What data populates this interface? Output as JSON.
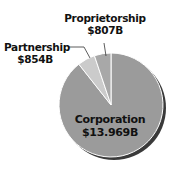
{
  "chart_data": {
    "type": "pie",
    "title": "",
    "categories": [
      "Corporation",
      "Partnership",
      "Proprietorship"
    ],
    "values": [
      13969,
      854,
      807
    ],
    "value_labels": [
      "$13.969B",
      "$854B",
      "$807B"
    ],
    "units": "billions of dollars",
    "colors": [
      "#9b9b9b",
      "#cbcbcb",
      "#a8a8a8"
    ],
    "legend": "none (direct labels)",
    "shadow": true
  },
  "labels": {
    "proprietorship": {
      "name": "Proprietorship",
      "value": "$807B"
    },
    "partnership": {
      "name": "Partnership",
      "value": "$854B"
    },
    "corporation": {
      "name": "Corporation",
      "value": "$13.969B"
    }
  }
}
